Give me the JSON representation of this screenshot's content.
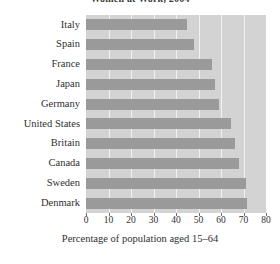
{
  "chart_data": {
    "type": "bar",
    "orientation": "horizontal",
    "title": "Women at Work, 2004",
    "xlabel": "Percentage of population aged 15–64",
    "ylabel": "",
    "categories": [
      "Italy",
      "Spain",
      "France",
      "Japan",
      "Germany",
      "United States",
      "Britain",
      "Canada",
      "Sweden",
      "Denmark"
    ],
    "values": [
      45,
      48,
      56,
      57.5,
      59,
      64.5,
      66,
      68,
      71,
      71.5
    ],
    "xlim": [
      0,
      80
    ],
    "xticks": [
      0,
      10,
      20,
      30,
      40,
      50,
      60,
      70,
      80
    ],
    "xtick_labels": [
      "0",
      "10",
      "20",
      "30",
      "40",
      "50",
      "60",
      "70",
      "80"
    ],
    "grid": true,
    "legend": null,
    "bar_color": "#9a9a9a",
    "plot_background": "#d3d3d3",
    "grid_color": "#f2f2f2"
  }
}
